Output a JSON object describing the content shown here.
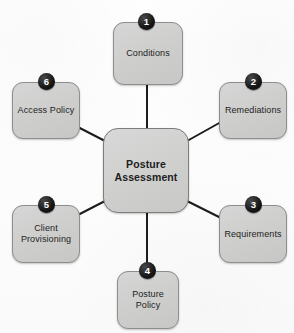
{
  "diagram": {
    "type": "hub-and-spoke",
    "title": "Posture Assessment",
    "hub": {
      "label": "Posture\nAssessment",
      "x": 103,
      "y": 128,
      "w": 86,
      "h": 85
    },
    "nodes": [
      {
        "id": "conditions",
        "badge": "1",
        "label": "Conditions",
        "x": 113,
        "y": 22,
        "w": 70,
        "h": 63,
        "badge_x": 138,
        "badge_y": 13
      },
      {
        "id": "remediations",
        "badge": "2",
        "label": "Remediations",
        "x": 219,
        "y": 82,
        "w": 68,
        "h": 57,
        "badge_x": 245,
        "badge_y": 73
      },
      {
        "id": "requirements",
        "badge": "3",
        "label": "Requirements",
        "x": 219,
        "y": 205,
        "w": 68,
        "h": 58,
        "badge_x": 245,
        "badge_y": 196
      },
      {
        "id": "posture-policy",
        "badge": "4",
        "label": "Posture\nPolicy",
        "x": 117,
        "y": 271,
        "w": 62,
        "h": 58,
        "badge_x": 139,
        "badge_y": 262
      },
      {
        "id": "client-provisioning",
        "badge": "5",
        "label": "Client\nProvisioning",
        "x": 12,
        "y": 205,
        "w": 68,
        "h": 58,
        "badge_x": 38,
        "badge_y": 196
      },
      {
        "id": "access-policy",
        "badge": "6",
        "label": "Access Policy",
        "x": 12,
        "y": 82,
        "w": 68,
        "h": 57,
        "badge_x": 38,
        "badge_y": 73
      }
    ],
    "edges": [
      {
        "id": "edge-hub-conditions",
        "x1": 147,
        "y1": 85,
        "x2": 147,
        "y2": 128
      },
      {
        "id": "edge-hub-remediations",
        "x1": 187,
        "y1": 141,
        "x2": 221,
        "y2": 122
      },
      {
        "id": "edge-hub-requirements",
        "x1": 187,
        "y1": 201,
        "x2": 221,
        "y2": 218
      },
      {
        "id": "edge-hub-posture-policy",
        "x1": 147,
        "y1": 213,
        "x2": 147,
        "y2": 270
      },
      {
        "id": "edge-hub-client-provisioning",
        "x1": 105,
        "y1": 201,
        "x2": 72,
        "y2": 218
      },
      {
        "id": "edge-hub-access-policy",
        "x1": 105,
        "y1": 141,
        "x2": 72,
        "y2": 124
      }
    ],
    "style": {
      "node_fill": "#cfcfcf",
      "node_border": "#8e8e8e",
      "badge_fill": "#141414",
      "badge_text": "#ffffff",
      "edge_color": "#1c1c1c",
      "background": "#fdfdfd"
    }
  }
}
